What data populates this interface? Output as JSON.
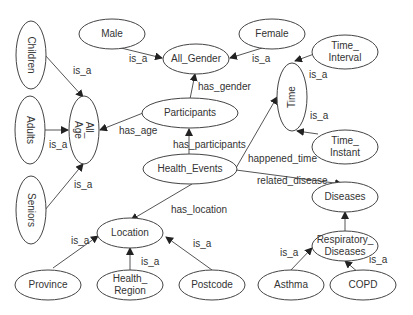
{
  "diagram": {
    "type": "ontology-graph",
    "nodes": {
      "children": {
        "label": "Children"
      },
      "adults": {
        "label": "Adults"
      },
      "seniors": {
        "label": "Seniors"
      },
      "all_age": {
        "label_line1": "All_",
        "label_line2": "Age"
      },
      "male": {
        "label": "Male"
      },
      "female": {
        "label": "Female"
      },
      "all_gender": {
        "label": "All_Gender"
      },
      "participants": {
        "label": "Participants"
      },
      "time_interval": {
        "label_line1": "Time_",
        "label_line2": "Interval"
      },
      "time": {
        "label": "Time"
      },
      "time_instant": {
        "label_line1": "Time_",
        "label_line2": "Instant"
      },
      "health_events": {
        "label": "Health_Events"
      },
      "diseases": {
        "label": "Diseases"
      },
      "location": {
        "label": "Location"
      },
      "respiratory_diseases": {
        "label_line1": "Respiratory_",
        "label_line2": "Diseases"
      },
      "province": {
        "label": "Province"
      },
      "health_region": {
        "label_line1": "Health_",
        "label_line2": "Region"
      },
      "postcode": {
        "label": "Postcode"
      },
      "asthma": {
        "label": "Asthma"
      },
      "copd": {
        "label": "COPD"
      }
    },
    "edges": [
      {
        "from": "Children",
        "to": "All_Age",
        "label": "is_a"
      },
      {
        "from": "Adults",
        "to": "All_Age",
        "label": "is_a"
      },
      {
        "from": "Seniors",
        "to": "All_Age",
        "label": "is_a"
      },
      {
        "from": "Male",
        "to": "All_Gender",
        "label": "is_a"
      },
      {
        "from": "Female",
        "to": "All_Gender",
        "label": "is_a"
      },
      {
        "from": "Participants",
        "to": "All_Gender",
        "label": "has_gender"
      },
      {
        "from": "Participants",
        "to": "All_Age",
        "label": "has_age"
      },
      {
        "from": "Health_Events",
        "to": "Participants",
        "label": "has_participants"
      },
      {
        "from": "Health_Events",
        "to": "Time",
        "label": "happened_time"
      },
      {
        "from": "Health_Events",
        "to": "Diseases",
        "label": "related_disease"
      },
      {
        "from": "Health_Events",
        "to": "Location",
        "label": "has_location"
      },
      {
        "from": "Time_Interval",
        "to": "Time",
        "label": "is_a"
      },
      {
        "from": "Time_Instant",
        "to": "Time",
        "label": "is_a"
      },
      {
        "from": "Province",
        "to": "Location",
        "label": "is_a"
      },
      {
        "from": "Health_Region",
        "to": "Location",
        "label": "is_a"
      },
      {
        "from": "Postcode",
        "to": "Location",
        "label": "is_a"
      },
      {
        "from": "Respiratory_Diseases",
        "to": "Diseases",
        "label": ""
      },
      {
        "from": "Asthma",
        "to": "Respiratory_Diseases",
        "label": "is_a"
      },
      {
        "from": "COPD",
        "to": "Respiratory_Diseases",
        "label": "is_a"
      }
    ],
    "edge_labels": {
      "children_is_a": "is_a",
      "adults_is_a": "is_a",
      "seniors_is_a": "is_a",
      "male_is_a": "is_a",
      "female_is_a": "is_a",
      "has_gender": "has_gender",
      "has_age": "has_age",
      "has_participants": "has_participants",
      "happened_time": "happened_time",
      "related_disease": "related_disease",
      "has_location": "has_location",
      "interval_is_a": "is_a",
      "instant_is_a": "is_a",
      "province_is_a": "is_a",
      "region_is_a": "is_a",
      "postcode_is_a": "is_a",
      "asthma_is_a": "is_a",
      "copd_is_a": "is_a"
    }
  }
}
